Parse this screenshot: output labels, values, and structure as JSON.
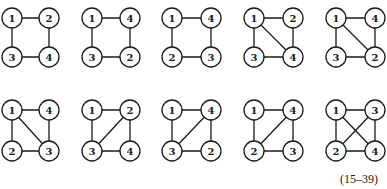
{
  "caption": "(15–39)",
  "layout": {
    "columns": [
      [
        12,
        49
      ],
      [
        92,
        130
      ],
      [
        172,
        211
      ],
      [
        254,
        293
      ],
      [
        336,
        375
      ]
    ],
    "rows": [
      [
        18,
        57
      ],
      [
        110,
        151
      ]
    ],
    "node_radius": 10
  },
  "graphs": [
    {
      "row": 0,
      "col": 0,
      "labels": {
        "TL": "1",
        "TR": "2",
        "BL": "3",
        "BR": "4"
      },
      "edges": [
        [
          "TL",
          "TR"
        ],
        [
          "TL",
          "BL"
        ],
        [
          "BL",
          "BR"
        ],
        [
          "TR",
          "BR"
        ]
      ]
    },
    {
      "row": 0,
      "col": 1,
      "labels": {
        "TL": "1",
        "TR": "4",
        "BL": "3",
        "BR": "2"
      },
      "edges": [
        [
          "TL",
          "TR"
        ],
        [
          "TL",
          "BL"
        ],
        [
          "BL",
          "BR"
        ],
        [
          "TR",
          "BR"
        ]
      ]
    },
    {
      "row": 0,
      "col": 2,
      "labels": {
        "TL": "1",
        "TR": "4",
        "BL": "2",
        "BR": "3"
      },
      "edges": [
        [
          "TL",
          "TR"
        ],
        [
          "TL",
          "BL"
        ],
        [
          "BL",
          "BR"
        ],
        [
          "TR",
          "BR"
        ]
      ]
    },
    {
      "row": 0,
      "col": 3,
      "labels": {
        "TL": "1",
        "TR": "2",
        "BL": "3",
        "BR": "4"
      },
      "edges": [
        [
          "TL",
          "TR"
        ],
        [
          "TL",
          "BL"
        ],
        [
          "BL",
          "BR"
        ],
        [
          "TR",
          "BR"
        ],
        [
          "TL",
          "BR"
        ]
      ]
    },
    {
      "row": 0,
      "col": 4,
      "labels": {
        "TL": "1",
        "TR": "4",
        "BL": "3",
        "BR": "2"
      },
      "edges": [
        [
          "TL",
          "TR"
        ],
        [
          "TL",
          "BL"
        ],
        [
          "BL",
          "BR"
        ],
        [
          "TR",
          "BR"
        ],
        [
          "TL",
          "BR"
        ]
      ]
    },
    {
      "row": 1,
      "col": 0,
      "labels": {
        "TL": "1",
        "TR": "4",
        "BL": "2",
        "BR": "3"
      },
      "edges": [
        [
          "TL",
          "TR"
        ],
        [
          "TL",
          "BL"
        ],
        [
          "BL",
          "BR"
        ],
        [
          "TR",
          "BR"
        ],
        [
          "TL",
          "BR"
        ]
      ]
    },
    {
      "row": 1,
      "col": 1,
      "labels": {
        "TL": "1",
        "TR": "2",
        "BL": "3",
        "BR": "4"
      },
      "edges": [
        [
          "TL",
          "TR"
        ],
        [
          "TL",
          "BL"
        ],
        [
          "BL",
          "BR"
        ],
        [
          "TR",
          "BR"
        ],
        [
          "BL",
          "TR"
        ]
      ]
    },
    {
      "row": 1,
      "col": 2,
      "labels": {
        "TL": "1",
        "TR": "4",
        "BL": "3",
        "BR": "2"
      },
      "edges": [
        [
          "TL",
          "TR"
        ],
        [
          "TL",
          "BL"
        ],
        [
          "BL",
          "BR"
        ],
        [
          "TR",
          "BR"
        ],
        [
          "BL",
          "TR"
        ]
      ]
    },
    {
      "row": 1,
      "col": 3,
      "labels": {
        "TL": "1",
        "TR": "4",
        "BL": "2",
        "BR": "3"
      },
      "edges": [
        [
          "TL",
          "TR"
        ],
        [
          "TL",
          "BL"
        ],
        [
          "BL",
          "BR"
        ],
        [
          "TR",
          "BR"
        ],
        [
          "BL",
          "TR"
        ]
      ]
    },
    {
      "row": 1,
      "col": 4,
      "labels": {
        "TL": "1",
        "TR": "3",
        "BL": "2",
        "BR": "4"
      },
      "edges": [
        [
          "TL",
          "TR"
        ],
        [
          "TL",
          "BL"
        ],
        [
          "BL",
          "BR"
        ],
        [
          "TR",
          "BR"
        ],
        [
          "TL",
          "BR"
        ],
        [
          "BL",
          "TR"
        ]
      ]
    }
  ]
}
